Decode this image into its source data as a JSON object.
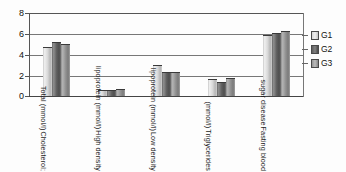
{
  "chart_data": {
    "type": "bar",
    "title": "",
    "xlabel": "",
    "ylabel": "",
    "ylim": [
      0,
      8
    ],
    "yticks": [
      "0",
      "2",
      "4",
      "6",
      "8"
    ],
    "grid": true,
    "legend_position": "right",
    "categories": [
      "Cholesterol; Total (mmol/l)",
      "High density lipoprotein (mmol/l)",
      "Low density lipoprotein (mmol/l)",
      "Triglycerides (mmol/l)",
      "Fasting blood sugar disease"
    ],
    "category_lines": [
      [
        "Cholesterol;",
        "Total (mmol/l)"
      ],
      [
        "High density",
        "lipoprotein (mmol/l)"
      ],
      [
        "Low density",
        "lipoprotein (mmol/l)"
      ],
      [
        "Triglycerides",
        "(mmol/l)"
      ],
      [
        "Fasting blood",
        "sugar disease"
      ]
    ],
    "series": [
      {
        "name": "G1",
        "color": "#d8d8d8",
        "values": [
          4.65,
          0.5,
          2.9,
          1.5,
          5.8
        ]
      },
      {
        "name": "G2",
        "color": "#5f5f5f",
        "values": [
          5.1,
          0.52,
          2.25,
          1.25,
          5.95
        ]
      },
      {
        "name": "G3",
        "color": "#919191",
        "values": [
          4.9,
          0.6,
          2.2,
          1.6,
          6.2
        ]
      }
    ]
  },
  "legend": {
    "items": [
      {
        "label": "G1"
      },
      {
        "label": "G2"
      },
      {
        "label": "G3"
      }
    ]
  }
}
